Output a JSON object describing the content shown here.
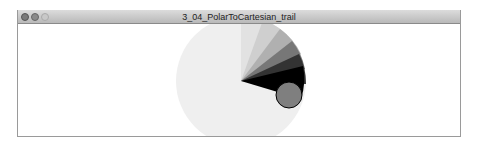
{
  "window": {
    "title": "3_04_PolarToCartesian_trail",
    "controls": [
      "close",
      "minimize",
      "zoom"
    ]
  },
  "sketch": {
    "background": "#ffffff",
    "trail_color": "#000000",
    "ball_fill": "#7f7f7f",
    "ball_stroke": "#000000"
  }
}
